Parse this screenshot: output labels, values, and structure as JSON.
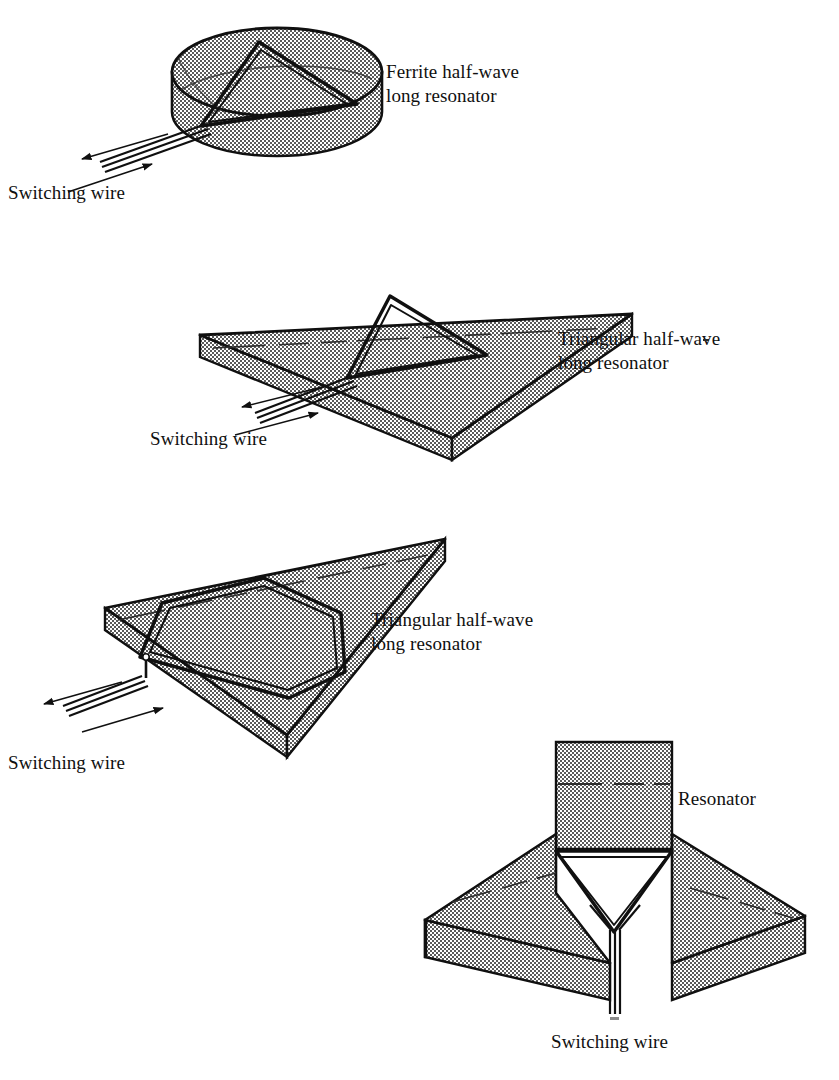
{
  "page": {
    "background": "#ffffff",
    "ink": "#101010",
    "fill_gray": "#9a9a9a",
    "width": 839,
    "height": 1080
  },
  "figures": [
    {
      "id": "ferrite-disc-resonator",
      "shape": "cylinder",
      "resonator": "triangular-loop",
      "label": "Ferrite half-wave\nlong resonator",
      "wire_label": "Switching wire"
    },
    {
      "id": "triangular-slab-triangle-resonator",
      "shape": "triangular-prism",
      "resonator": "triangular-loop",
      "label": "Triangular half-wave\nlong resonator",
      "wire_label": "Switching wire"
    },
    {
      "id": "triangular-slab-hexagon-resonator",
      "shape": "triangular-prism",
      "resonator": "hexagonal-loop",
      "label": "Triangular half-wave\nlong resonator",
      "wire_label": "Switching wire"
    },
    {
      "id": "y-junction-three-arm",
      "shape": "three-arm-junction",
      "resonator": "triangular-loop",
      "label": "Resonator",
      "wire_label": "Switching wire"
    }
  ],
  "labels": {
    "ferrite_half_wave_line1": "Ferrite half-wave",
    "ferrite_half_wave_line2": "long resonator",
    "triangular_half_wave_line1": "Triangular half-wave",
    "triangular_half_wave_line2": "long resonator",
    "resonator": "Resonator",
    "switching_wire": "Switching wire"
  }
}
